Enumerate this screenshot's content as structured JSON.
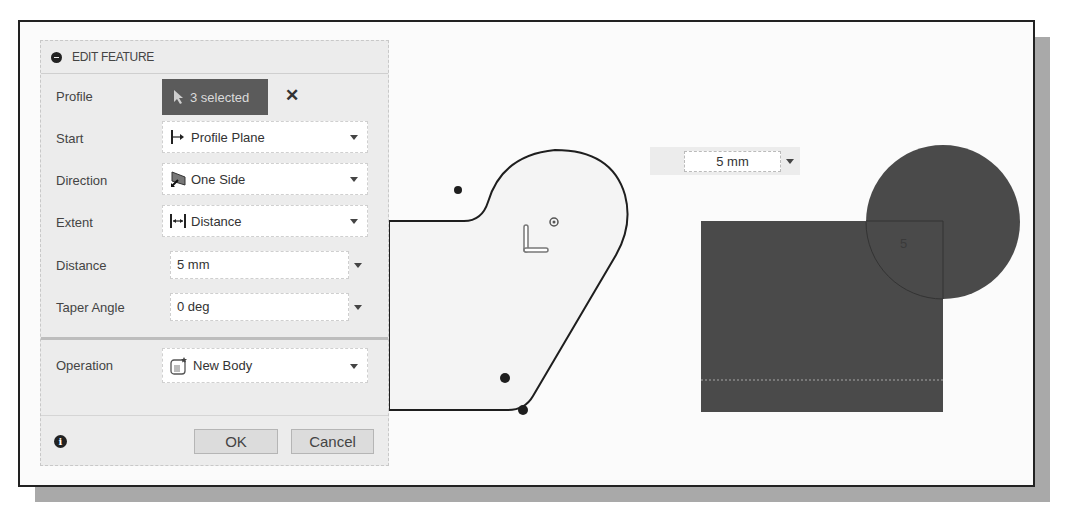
{
  "panel": {
    "title": "EDIT FEATURE",
    "rows": {
      "profile": {
        "label": "Profile",
        "value": "3 selected",
        "icon": "cursor-arrow-icon",
        "clear": "✕"
      },
      "start": {
        "label": "Start",
        "value": "Profile Plane",
        "icon": "profile-plane-icon"
      },
      "direction": {
        "label": "Direction",
        "value": "One Side",
        "icon": "one-side-icon"
      },
      "extent": {
        "label": "Extent",
        "value": "Distance",
        "icon": "distance-icon"
      },
      "distance": {
        "label": "Distance",
        "value": "5 mm"
      },
      "taper": {
        "label": "Taper Angle",
        "value": "0 deg"
      },
      "operation": {
        "label": "Operation",
        "value": "New Body",
        "icon": "new-body-icon"
      }
    },
    "footer": {
      "info": "i",
      "ok": "OK",
      "cancel": "Cancel"
    }
  },
  "viewport": {
    "dimension_input": "5 mm",
    "dimension_label": "5",
    "colors": {
      "profile_fill": "#f4f4f4",
      "extruded_body": "#4a4a4a",
      "outline": "#1e1e1e",
      "selection": "#5b5b5b"
    }
  }
}
